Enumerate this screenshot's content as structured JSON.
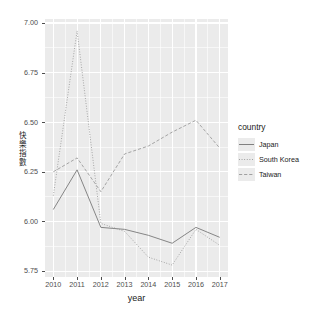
{
  "chart_data": {
    "type": "line",
    "title": "",
    "xlabel": "year",
    "ylabel": "快樂指數",
    "x": [
      2010,
      2011,
      2012,
      2013,
      2014,
      2015,
      2016,
      2017
    ],
    "xticklabels": [
      "2010",
      "2011",
      "2012",
      "2013",
      "2014",
      "2015",
      "2016",
      "2017"
    ],
    "yticklabels": [
      "5.75",
      "6.00",
      "6.25",
      "6.50",
      "6.75",
      "7.00"
    ],
    "yticks": [
      5.75,
      6.0,
      6.25,
      6.5,
      6.75,
      7.0
    ],
    "ylim": [
      5.72,
      7.02
    ],
    "xlim": [
      2009.65,
      2017.35
    ],
    "grid": true,
    "legend_position": "right",
    "legend_title": "country",
    "series": [
      {
        "name": "Japan",
        "linestyle": "solid",
        "color": "#808080",
        "values": [
          6.06,
          6.26,
          5.97,
          5.96,
          5.93,
          5.89,
          5.97,
          5.92
        ]
      },
      {
        "name": "South Korea",
        "linestyle": "dotted",
        "color": "#9a9a9a",
        "values": [
          6.13,
          6.96,
          5.99,
          5.95,
          5.82,
          5.78,
          5.96,
          5.88
        ]
      },
      {
        "name": "Taiwan",
        "linestyle": "dashed",
        "color": "#a0a0a0",
        "values": [
          6.25,
          6.32,
          6.15,
          6.34,
          6.38,
          6.45,
          6.51,
          6.37
        ]
      }
    ],
    "theme": {
      "panel_background": "#ebebeb",
      "grid_color": "#ffffff",
      "plot_background": "#ffffff",
      "text_color": "#1a1a1a",
      "axis_text_color": "#4d4d4d"
    }
  }
}
